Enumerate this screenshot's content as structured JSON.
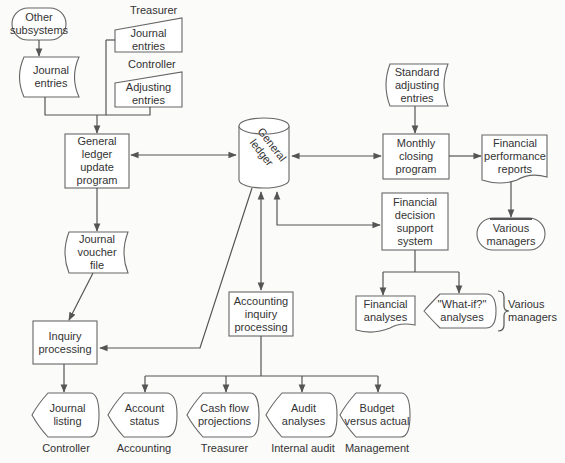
{
  "diagram": {
    "type": "flowchart",
    "colors": {
      "stroke": "#555555",
      "fill": "#ffffff",
      "text": "#333333",
      "background": "#fbfbfa"
    }
  },
  "nodes": {
    "other_subsystems": {
      "label": "Other\nsubsystems",
      "shape": "terminal"
    },
    "journal_entries_doc": {
      "label": "Journal\nentries",
      "shape": "stored-data"
    },
    "treasurer_caption": {
      "label": "Treasurer"
    },
    "treasurer_journal_entries": {
      "label": "Journal\nentries",
      "shape": "manual-input"
    },
    "controller_caption": {
      "label": "Controller"
    },
    "controller_adjusting_entries": {
      "label": "Adjusting\nentries",
      "shape": "manual-input"
    },
    "gl_update_program": {
      "label": "General\nledger\nupdate\nprogram",
      "shape": "process"
    },
    "journal_voucher_file": {
      "label": "Journal\nvoucher\nfile",
      "shape": "stored-data"
    },
    "inquiry_processing": {
      "label": "Inquiry\nprocessing",
      "shape": "process"
    },
    "general_ledger": {
      "label": "General\nledger",
      "shape": "database"
    },
    "accounting_inquiry_processing": {
      "label": "Accounting\ninquiry\nprocessing",
      "shape": "process"
    },
    "standard_adjusting_entries": {
      "label": "Standard\nadjusting\nentries",
      "shape": "stored-data"
    },
    "monthly_closing_program": {
      "label": "Monthly\nclosing\nprogram",
      "shape": "process"
    },
    "financial_performance_reports": {
      "label": "Financial\nperformance\nreports",
      "shape": "document"
    },
    "various_managers_terminal": {
      "label": "Various\nmanagers",
      "shape": "terminal"
    },
    "financial_decision_support": {
      "label": "Financial\ndecision\nsupport\nsystem",
      "shape": "process"
    },
    "financial_analyses": {
      "label": "Financial\nanalyses",
      "shape": "document"
    },
    "what_if_analyses": {
      "label": "\"What-if?\"\nanalyses",
      "shape": "display"
    },
    "various_managers_bracket": {
      "label": "Various\nmanagers"
    }
  },
  "outputs": [
    {
      "label": "Journal\nlisting",
      "caption": "Controller",
      "shape": "display"
    },
    {
      "label": "Account\nstatus",
      "caption": "Accounting",
      "shape": "display"
    },
    {
      "label": "Cash flow\nprojections",
      "caption": "Treasurer",
      "shape": "display"
    },
    {
      "label": "Audit\nanalyses",
      "caption": "Internal audit",
      "shape": "display"
    },
    {
      "label": "Budget\nversus actual",
      "caption": "Management",
      "shape": "display"
    }
  ],
  "edges": [
    {
      "from": "Other subsystems",
      "to": "Journal entries"
    },
    {
      "from": "Journal entries",
      "to": "General ledger update program"
    },
    {
      "from": "Treasurer Journal entries",
      "to": "General ledger update program"
    },
    {
      "from": "Controller Adjusting entries",
      "to": "General ledger update program"
    },
    {
      "from": "General ledger",
      "to": "General ledger update program",
      "bidirectional": true
    },
    {
      "from": "General ledger update program",
      "to": "Journal voucher file"
    },
    {
      "from": "Journal voucher file",
      "to": "Inquiry processing"
    },
    {
      "from": "General ledger",
      "to": "Inquiry processing"
    },
    {
      "from": "Inquiry processing",
      "to": "Journal listing"
    },
    {
      "from": "General ledger",
      "to": "Accounting inquiry processing",
      "bidirectional": true
    },
    {
      "from": "Accounting inquiry processing",
      "to": "Account status"
    },
    {
      "from": "Accounting inquiry processing",
      "to": "Cash flow projections"
    },
    {
      "from": "Accounting inquiry processing",
      "to": "Audit analyses"
    },
    {
      "from": "Accounting inquiry processing",
      "to": "Budget versus actual"
    },
    {
      "from": "General ledger",
      "to": "Monthly closing program",
      "bidirectional": true
    },
    {
      "from": "Standard adjusting entries",
      "to": "Monthly closing program"
    },
    {
      "from": "Monthly closing program",
      "to": "Financial performance reports"
    },
    {
      "from": "Financial performance reports",
      "to": "Various managers"
    },
    {
      "from": "General ledger",
      "to": "Financial decision support system",
      "bidirectional": true
    },
    {
      "from": "Financial decision support system",
      "to": "Financial analyses"
    },
    {
      "from": "Financial decision support system",
      "to": "\"What-if?\" analyses"
    }
  ]
}
